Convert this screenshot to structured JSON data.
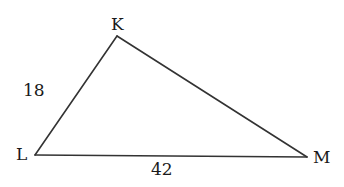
{
  "diagram": {
    "type": "triangle",
    "name": "Triangle KLM",
    "stroke_color": "#333333",
    "text_color": "#1a1a1a",
    "background": "#ffffff",
    "vertices": [
      {
        "name": "K",
        "x": 117,
        "y": 36
      },
      {
        "name": "L",
        "x": 35,
        "y": 155
      },
      {
        "name": "M",
        "x": 307,
        "y": 157
      }
    ],
    "labels": {
      "vertex_k": "K",
      "vertex_l": "L",
      "vertex_m": "M",
      "side_kl": "18",
      "side_lm": "42"
    },
    "sides": [
      {
        "from": "K",
        "to": "L",
        "length": "18"
      },
      {
        "from": "L",
        "to": "M",
        "length": "42"
      },
      {
        "from": "M",
        "to": "K",
        "length": ""
      }
    ]
  }
}
